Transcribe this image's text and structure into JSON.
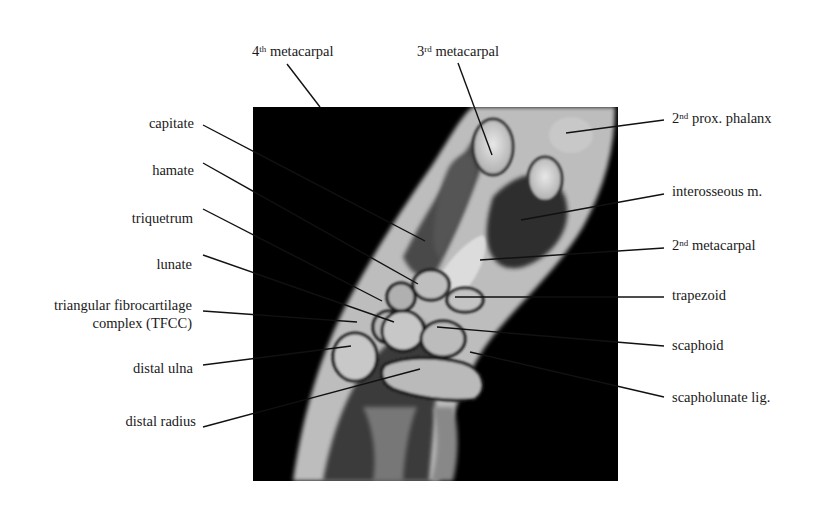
{
  "figure": {
    "image_box": {
      "x": 253,
      "y": 107,
      "width": 365,
      "height": 374
    },
    "colors": {
      "background": "#ffffff",
      "image_bg": "#000000",
      "text": "#1a1a1a",
      "leader": "#111111"
    }
  },
  "labels": {
    "top": [
      {
        "id": "4th-metacarpal",
        "base": "4",
        "sup": "th",
        "text": " metacarpal"
      },
      {
        "id": "3rd-metacarpal",
        "base": "3",
        "sup": "rd",
        "text": " metacarpal"
      }
    ],
    "left": [
      {
        "id": "capitate",
        "text": "capitate"
      },
      {
        "id": "hamate",
        "text": "hamate"
      },
      {
        "id": "triquetrum",
        "text": "triquetrum"
      },
      {
        "id": "lunate",
        "text": "lunate"
      },
      {
        "id": "tfcc",
        "line1": "triangular fibrocartilage",
        "line2": "complex (TFCC)"
      },
      {
        "id": "distal-ulna",
        "text": "distal ulna"
      },
      {
        "id": "distal-radius",
        "text": "distal radius"
      }
    ],
    "right": [
      {
        "id": "2nd-prox-phalanx",
        "base": "2",
        "sup": "nd",
        "text": " prox. phalanx"
      },
      {
        "id": "interosseous-m",
        "text": "interosseous m."
      },
      {
        "id": "2nd-metacarpal",
        "base": "2",
        "sup": "nd",
        "text": " metacarpal"
      },
      {
        "id": "trapezoid",
        "text": "trapezoid"
      },
      {
        "id": "scaphoid",
        "text": "scaphoid"
      },
      {
        "id": "scapholunate-lig",
        "text": "scapholunate lig."
      }
    ]
  }
}
